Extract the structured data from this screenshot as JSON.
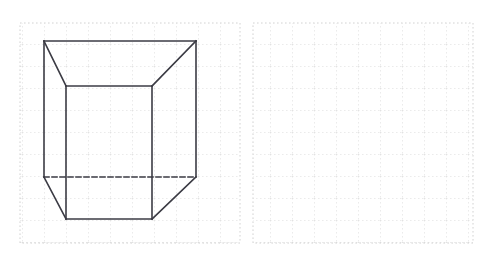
{
  "page": {
    "background_color": "#ffffff",
    "width": 496,
    "height": 261
  },
  "grid": {
    "style": "dotted",
    "cell_size_px": 22,
    "dot_color": "#c9c9c9",
    "line_color": "#d8d8d8",
    "left_panel": {
      "x": 20,
      "y": 23,
      "width": 220,
      "height": 220,
      "columns": 10,
      "rows": 10
    },
    "right_panel": {
      "x": 253,
      "y": 23,
      "width": 220,
      "height": 220,
      "columns": 10,
      "rows": 10
    }
  },
  "figure": {
    "name": "pentagonal-prism",
    "stroke_color": "#3b3b44",
    "stroke_width": 1.6,
    "hidden_edge_style": "dashed",
    "hidden_edge_dash": "5,3",
    "vertices": {
      "back_top_left": [
        44,
        41
      ],
      "back_top_right": [
        196,
        41
      ],
      "front_top_left": [
        66,
        86
      ],
      "front_top_right": [
        152,
        86
      ],
      "back_bottom_left": [
        44,
        177
      ],
      "back_bottom_right": [
        196,
        177
      ],
      "front_bottom_left": [
        66,
        219
      ],
      "front_bottom_right": [
        152,
        219
      ]
    },
    "solid_edges": [
      "back_top_left -> back_top_right",
      "back_top_left -> front_top_left",
      "back_top_right -> front_top_right",
      "front_top_left -> front_top_right",
      "back_top_left -> back_bottom_left",
      "back_top_right -> back_bottom_right",
      "front_top_left -> front_bottom_left",
      "front_top_right -> front_bottom_right",
      "back_bottom_left -> front_bottom_left",
      "back_bottom_right -> front_bottom_right",
      "front_bottom_left -> front_bottom_right"
    ],
    "hidden_edges": [
      "back_bottom_left -> back_bottom_right"
    ]
  },
  "right_panel": {
    "content": "empty-grid",
    "label": ""
  }
}
